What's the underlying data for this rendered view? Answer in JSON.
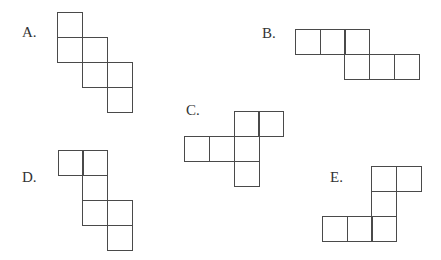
{
  "figures": [
    {
      "label": "A.",
      "label_pos": [
        22,
        24
      ],
      "squares": [
        [
          57,
          12
        ],
        [
          57,
          37
        ],
        [
          82,
          37
        ],
        [
          82,
          62
        ],
        [
          107,
          62
        ],
        [
          107,
          87
        ]
      ]
    },
    {
      "label": "B.",
      "label_pos": [
        262,
        25
      ],
      "squares": [
        [
          295,
          29
        ],
        [
          320,
          29
        ],
        [
          344,
          29
        ],
        [
          344,
          54
        ],
        [
          369,
          54
        ],
        [
          394,
          54
        ]
      ]
    },
    {
      "label": "C.",
      "label_pos": [
        186,
        102
      ],
      "squares": [
        [
          234,
          111
        ],
        [
          258,
          111
        ],
        [
          184,
          136
        ],
        [
          209,
          136
        ],
        [
          234,
          136
        ],
        [
          234,
          161
        ]
      ]
    },
    {
      "label": "D.",
      "label_pos": [
        22,
        169
      ],
      "squares": [
        [
          58,
          150
        ],
        [
          82,
          150
        ],
        [
          82,
          175
        ],
        [
          82,
          200
        ],
        [
          107,
          200
        ],
        [
          107,
          225
        ]
      ]
    },
    {
      "label": "E.",
      "label_pos": [
        330,
        169
      ],
      "squares": [
        [
          371,
          166
        ],
        [
          396,
          166
        ],
        [
          371,
          191
        ],
        [
          322,
          216
        ],
        [
          347,
          216
        ],
        [
          371,
          216
        ]
      ]
    }
  ],
  "square_size": 25
}
